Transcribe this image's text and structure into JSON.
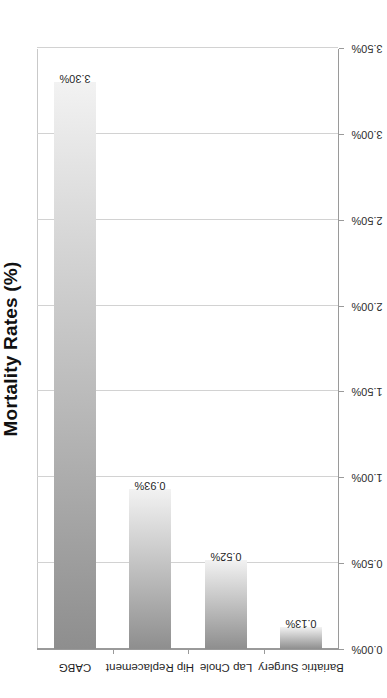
{
  "chart_data": {
    "type": "bar",
    "orientation": "horizontal",
    "title": "Mortality Rates (%)",
    "xlabel": "",
    "ylabel": "",
    "categories": [
      "Bariatric Surgery",
      "Lap Chole",
      "Hip Replacement",
      "CABG"
    ],
    "values": [
      0.13,
      0.52,
      0.93,
      3.3
    ],
    "value_labels": [
      "0.13%",
      "0.52%",
      "0.93%",
      "3.30%"
    ],
    "series": [
      {
        "name": "Mortality Rate",
        "values": [
          0.13,
          0.52,
          0.93,
          3.3
        ]
      }
    ],
    "xlim": [
      0.0,
      3.5
    ],
    "tick_values": [
      0.0,
      0.5,
      1.0,
      1.5,
      2.0,
      2.5,
      3.0,
      3.5
    ],
    "tick_labels": [
      "0.00%",
      "0.50%",
      "1.00%",
      "1.50%",
      "2.00%",
      "2.50%",
      "3.00%",
      "3.50%"
    ],
    "grid": true,
    "grid_axis": "value",
    "legend": false,
    "legend_position": "none",
    "bar_fill_start_color": "#8e8e8e",
    "bar_fill_end_color": "#f2f2f2",
    "axis_color": "#9a9a9a",
    "gridline_color": "#d2d2d2",
    "text_color": "#1f1f1f",
    "background_color": "#ffffff",
    "rotation_note": "chart rendered rotated 90 degrees counter-clockwise"
  }
}
